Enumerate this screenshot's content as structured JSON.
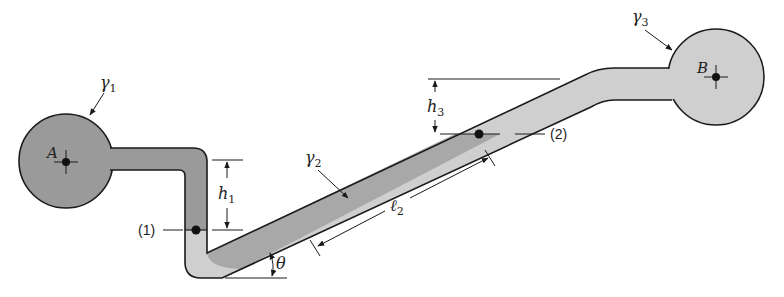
{
  "diagram": {
    "type": "manometer / pipe system between two reservoirs",
    "colors": {
      "fluid_dark": "#9a9a9a",
      "fluid_light": "#cfcfcf",
      "outline": "#1a1a1a",
      "background": "#ffffff"
    },
    "reservoirs": [
      {
        "id": "A",
        "label": "A",
        "fluid_label": "γ",
        "fluid_subscript": "1"
      },
      {
        "id": "B",
        "label": "B",
        "fluid_label": "γ",
        "fluid_subscript": "3"
      }
    ],
    "fluids": [
      {
        "label": "γ",
        "subscript": "1"
      },
      {
        "label": "γ",
        "subscript": "2"
      },
      {
        "label": "γ",
        "subscript": "3"
      }
    ],
    "points": [
      {
        "label": "(1)"
      },
      {
        "label": "(2)"
      }
    ],
    "dimensions": {
      "h1": {
        "symbol": "h",
        "subscript": "1"
      },
      "h3": {
        "symbol": "h",
        "subscript": "3"
      },
      "l2": {
        "symbol": "ℓ",
        "subscript": "2"
      },
      "theta": {
        "symbol": "θ"
      }
    }
  }
}
